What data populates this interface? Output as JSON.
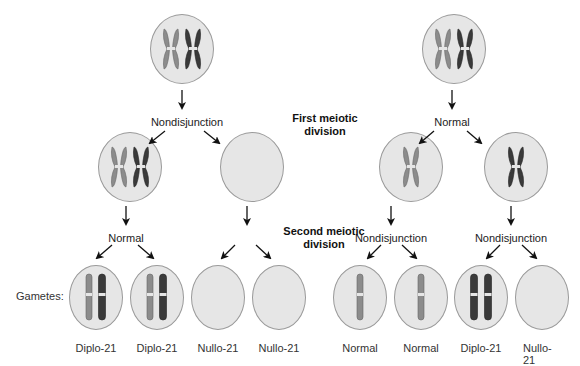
{
  "stages": {
    "first": "First meiotic\ndivision",
    "first_line1": "First meiotic",
    "first_line2": "division",
    "second_line1": "Second meiotic",
    "second_line2": "division"
  },
  "left_pathway": {
    "first_division_event": "Nondisjunction",
    "second_division_event": "Normal"
  },
  "right_pathway": {
    "first_division_event": "Normal",
    "second_division_event": "Nondisjunction"
  },
  "gametes_label": "Gametes:",
  "gametes": [
    {
      "label": "Diplo-21",
      "chromosomes": [
        "light",
        "dark"
      ]
    },
    {
      "label": "Diplo-21",
      "chromosomes": [
        "light",
        "dark"
      ]
    },
    {
      "label": "Nullo-21",
      "chromosomes": []
    },
    {
      "label": "Nullo-21",
      "chromosomes": []
    },
    {
      "label": "Normal",
      "chromosomes": [
        "light"
      ]
    },
    {
      "label": "Normal",
      "chromosomes": [
        "light"
      ]
    },
    {
      "label": "Diplo-21",
      "chromosomes": [
        "dark",
        "dark"
      ]
    },
    {
      "label": "Nullo-21",
      "chromosomes": []
    }
  ],
  "colors": {
    "cell_fill": "#e6e6e6",
    "cell_border": "#9a9a9a",
    "chromosome_light": "#8c8c8c",
    "chromosome_dark": "#3a3a3a",
    "arrow": "#111111"
  }
}
